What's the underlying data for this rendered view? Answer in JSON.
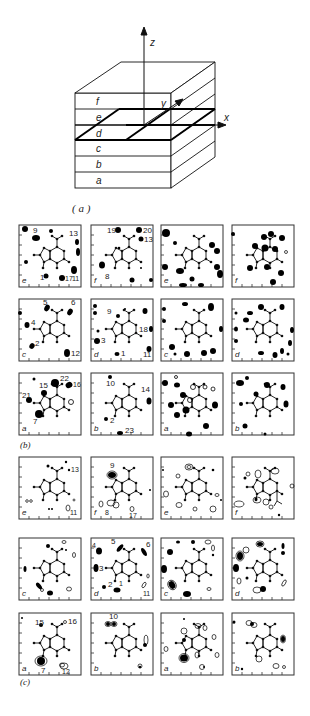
{
  "figure": {
    "panel_a": {
      "caption": "( a )",
      "axes": {
        "z": "z",
        "y": "y",
        "x": "x"
      },
      "layers": [
        "f",
        "e",
        "d",
        "c",
        "b",
        "a"
      ]
    },
    "panel_b": {
      "caption": "(b)",
      "rows": [
        [
          {
            "layer": "e",
            "peaks": [
              "9",
              "13",
              "1",
              "17",
              "11"
            ]
          },
          {
            "layer": "f",
            "peaks": [
              "19",
              "20",
              "13",
              "8"
            ]
          },
          {
            "layer": "e",
            "peaks": []
          },
          {
            "layer": "f",
            "peaks": []
          }
        ],
        [
          {
            "layer": "c",
            "peaks": [
              "5",
              "6",
              "4",
              "2",
              "12"
            ]
          },
          {
            "layer": "d",
            "peaks": [
              "9",
              "18",
              "3",
              "1",
              "11"
            ]
          },
          {
            "layer": "c",
            "peaks": []
          },
          {
            "layer": "d",
            "peaks": []
          }
        ],
        [
          {
            "layer": "a",
            "peaks": [
              "22",
              "16",
              "15",
              "21",
              "7"
            ]
          },
          {
            "layer": "b",
            "peaks": [
              "10",
              "14",
              "2",
              "23"
            ]
          },
          {
            "layer": "a",
            "peaks": []
          },
          {
            "layer": "b",
            "peaks": []
          }
        ]
      ]
    },
    "panel_c": {
      "caption": "(c)",
      "rows": [
        [
          {
            "layer": "e",
            "peaks": [
              "13",
              "11"
            ]
          },
          {
            "layer": "f",
            "peaks": [
              "9",
              "8",
              "17"
            ]
          },
          {
            "layer": "e",
            "peaks": []
          },
          {
            "layer": "f",
            "peaks": []
          }
        ],
        [
          {
            "layer": "c",
            "peaks": []
          },
          {
            "layer": "d",
            "peaks": [
              "5",
              "6",
              "4",
              "3",
              "2",
              "1",
              "11"
            ]
          },
          {
            "layer": "c",
            "peaks": []
          },
          {
            "layer": "d",
            "peaks": []
          }
        ],
        [
          {
            "layer": "a",
            "peaks": [
              "15",
              "16",
              "7",
              "12"
            ]
          },
          {
            "layer": "b",
            "peaks": [
              "10"
            ]
          },
          {
            "layer": "a",
            "peaks": []
          },
          {
            "layer": "b",
            "peaks": []
          }
        ]
      ]
    }
  }
}
